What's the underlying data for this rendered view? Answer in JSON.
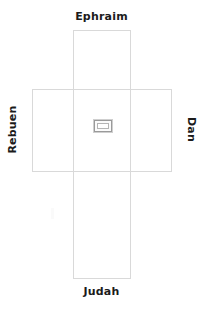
{
  "diagram": {
    "background_color": "#ffffff",
    "stroke_color": "#d9d9d9",
    "label_color": "#1b1b1b",
    "marker_border_color": "#9a9a9a",
    "labels": {
      "top": "Ephraim",
      "bottom": "Judah",
      "left": "Rebuen",
      "right": "Dan"
    },
    "center": {
      "name": "center-marker",
      "shape": "rectangle"
    },
    "bands": {
      "vertical": {
        "name": "vertical-band",
        "x": 73,
        "y": 30,
        "width": 58,
        "height": 249
      },
      "horizontal": {
        "name": "horizontal-band",
        "x": 32,
        "y": 89,
        "width": 140,
        "height": 83
      }
    }
  }
}
